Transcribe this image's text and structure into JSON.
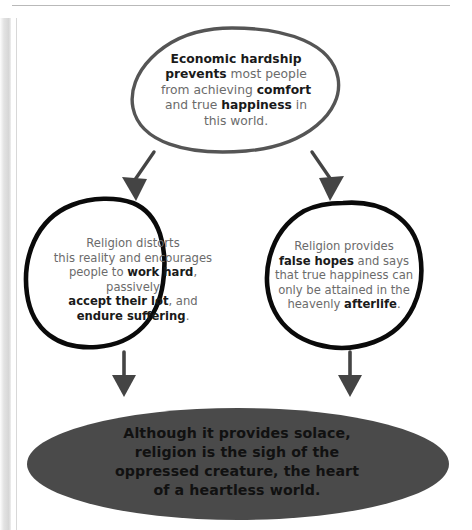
{
  "diagram": {
    "type": "flow-diagram",
    "colors": {
      "top_oval_stroke": "#555555",
      "mid_oval_stroke": "#0a0a0a",
      "bottom_ellipse_fill": "#4a4a4a",
      "arrow": "#444444",
      "body_text": "#6b6b6b",
      "emphasis_text": "#1a1a1a",
      "page_background": "#ffffff",
      "page_rule": "#b9b9b9"
    },
    "nodes": {
      "top": {
        "id": "economic-hardship",
        "shape": "oval",
        "lines": [
          "Economic hardship",
          "prevents most people",
          "from achieving comfort",
          "and true happiness in",
          "this world."
        ],
        "emphasis": [
          "Economic hardship",
          "prevents",
          "comfort",
          "happiness"
        ],
        "plain_text": "Economic hardship prevents most people from achieving comfort and true happiness in this world."
      },
      "left": {
        "id": "religion-distorts",
        "shape": "oval",
        "lines": [
          "Religion distorts",
          "this reality and encourages",
          "people to work hard, passively",
          "accept their lot, and",
          "endure suffering."
        ],
        "emphasis": [
          "work hard",
          "accept their lot",
          "endure suffering"
        ],
        "plain_text": "Religion distorts this reality and encourages people to work hard, passively accept their lot, and endure suffering."
      },
      "right": {
        "id": "religion-false-hopes",
        "shape": "oval",
        "lines": [
          "Religion provides",
          "false hopes and says",
          "that true happiness can",
          "only be attained in the",
          "heavenly afterlife."
        ],
        "emphasis": [
          "false hopes",
          "afterlife"
        ],
        "plain_text": "Religion provides false hopes and says that true happiness can only be attained in the heavenly afterlife."
      },
      "bottom": {
        "id": "sigh-of-oppressed-creature",
        "shape": "filled-ellipse",
        "lines": [
          "Although it provides solace,",
          "religion is the sigh of the",
          "oppressed creature, the heart",
          "of a heartless world."
        ],
        "plain_text": "Although it provides solace, religion is the sigh of the oppressed creature, the heart of a heartless world."
      }
    },
    "connectors": [
      {
        "id": "top-to-left",
        "from": "economic-hardship",
        "to": "religion-distorts",
        "style": "diagonal-arrow"
      },
      {
        "id": "top-to-right",
        "from": "economic-hardship",
        "to": "religion-false-hopes",
        "style": "diagonal-arrow"
      },
      {
        "id": "left-to-bottom",
        "from": "religion-distorts",
        "to": "sigh-of-oppressed-creature",
        "style": "vertical-arrow"
      },
      {
        "id": "right-to-bottom",
        "from": "religion-false-hopes",
        "to": "sigh-of-oppressed-creature",
        "style": "vertical-arrow"
      }
    ]
  }
}
